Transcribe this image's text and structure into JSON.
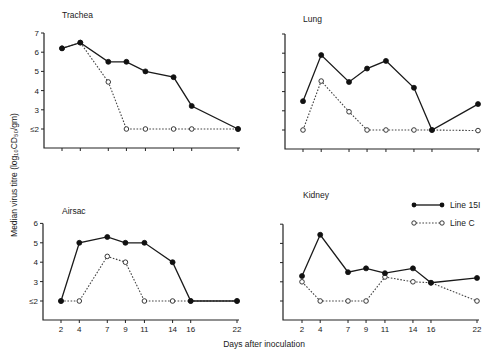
{
  "figure": {
    "y_axis_label": "Median virus titre (log₁₀CD₅₀/gm)",
    "x_axis_label": "Days after inoculation",
    "legend": [
      {
        "label": "Line 15I",
        "style": "solid-filled"
      },
      {
        "label": "Line C",
        "style": "dotted-open"
      }
    ]
  },
  "chart_data": [
    {
      "type": "line",
      "title": "Trachea",
      "xlabel": "Days after inoculation",
      "ylabel": "Median virus titre (log10CD50/gm)",
      "x": [
        2,
        4,
        7,
        9,
        11,
        14,
        16,
        22
      ],
      "yticks": [
        "≤2",
        "3",
        "4",
        "5",
        "6",
        "7"
      ],
      "ylim": [
        1,
        7
      ],
      "series": [
        {
          "name": "Line 15I",
          "values": [
            6.2,
            6.5,
            5.5,
            5.5,
            5.0,
            4.7,
            3.2,
            2.0
          ]
        },
        {
          "name": "Line C",
          "values": [
            6.2,
            6.5,
            4.45,
            2.0,
            2.0,
            2.0,
            2.0,
            2.0
          ]
        }
      ]
    },
    {
      "type": "line",
      "title": "Lung",
      "xlabel": "Days after inoculation",
      "ylabel": "Median virus titre (log10CD50/gm)",
      "x": [
        2,
        4,
        7,
        9,
        11,
        14,
        16,
        22
      ],
      "yticks": [
        "≤2",
        "3",
        "4",
        "5",
        "6",
        "7"
      ],
      "ylim": [
        1,
        7
      ],
      "series": [
        {
          "name": "Line 15I",
          "values": [
            3.5,
            5.9,
            4.5,
            5.2,
            5.6,
            4.2,
            2.0,
            3.35
          ]
        },
        {
          "name": "Line C",
          "values": [
            2.0,
            4.55,
            2.95,
            2.0,
            2.0,
            2.0,
            2.0,
            1.97
          ]
        }
      ]
    },
    {
      "type": "line",
      "title": "Airsac",
      "xlabel": "Days after inoculation",
      "ylabel": "Median virus titre (log10CD50/gm)",
      "x": [
        2,
        4,
        7,
        9,
        11,
        14,
        16,
        22
      ],
      "yticks": [
        "≤2",
        "3",
        "4",
        "5",
        "6"
      ],
      "ylim": [
        1,
        6
      ],
      "series": [
        {
          "name": "Line 15I",
          "values": [
            2.0,
            5.0,
            5.3,
            5.0,
            5.0,
            4.0,
            2.0,
            2.0
          ]
        },
        {
          "name": "Line C",
          "values": [
            2.0,
            2.0,
            4.3,
            4.0,
            2.0,
            2.0,
            2.0,
            2.0
          ]
        }
      ]
    },
    {
      "type": "line",
      "title": "Kidney",
      "xlabel": "Days after inoculation",
      "ylabel": "Median virus titre (log10CD50/gm)",
      "x": [
        2,
        4,
        7,
        9,
        11,
        14,
        16,
        22
      ],
      "yticks": [
        "≤2",
        "3",
        "4",
        "5",
        "6"
      ],
      "ylim": [
        1,
        6
      ],
      "series": [
        {
          "name": "Line 15I",
          "values": [
            3.3,
            5.45,
            3.5,
            3.7,
            3.45,
            3.7,
            2.95,
            3.2
          ]
        },
        {
          "name": "Line C",
          "values": [
            3.0,
            2.0,
            2.0,
            2.0,
            3.25,
            3.0,
            2.95,
            2.0
          ]
        }
      ]
    }
  ]
}
